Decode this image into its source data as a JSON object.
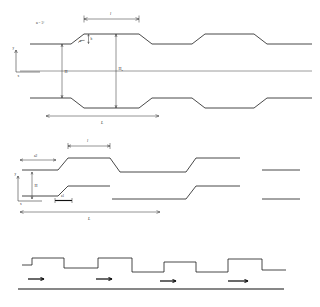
{
  "figure": {
    "background_color": "#ffffff",
    "line_color": "#1a1a1a",
    "panels": [
      {
        "id": "top-panel",
        "name": "symmetric-corrugated-channel",
        "description": "Symmetric wavy/corrugated channel with upper and lower trapezoidal walls and a centerline axis",
        "labels": {
          "angle_note": "α = 5°",
          "angle_symbol": "α",
          "step_height": "h",
          "half_height": "H",
          "inlet_height": "H",
          "inlet_height_sub": "0",
          "wave_length": "l",
          "total_length": "L",
          "axis_y": "y",
          "axis_x": "x"
        }
      },
      {
        "id": "middle-panel",
        "name": "asymmetric-stepped-channel",
        "description": "Asymmetric stepped channel with offset upper and lower walls",
        "labels": {
          "amplitude_upper": "a2",
          "amplitude_lower": "a1",
          "height": "H",
          "wave_length": "l",
          "total_length": "L",
          "axis_y": "y",
          "axis_x": "x"
        }
      },
      {
        "id": "bottom-panel",
        "name": "rectangular-ribbed-surface",
        "description": "Rectangular ribbed / crenellated surface over a flat plate with flow direction arrows",
        "labels": {
          "flow_arrows_count": "4"
        }
      }
    ]
  }
}
